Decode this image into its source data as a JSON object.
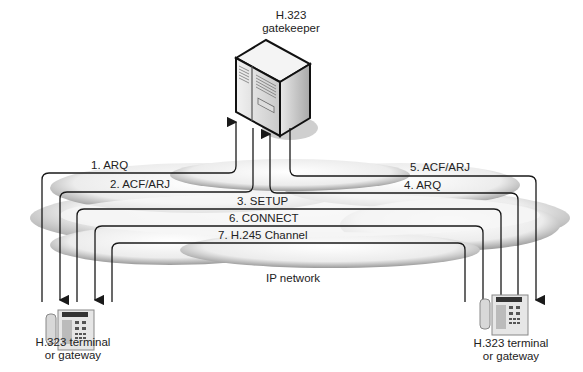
{
  "gatekeeper": {
    "label_line1": "H.323",
    "label_line2": "gatekeeper",
    "icon": "server-icon"
  },
  "network": {
    "label": "IP network",
    "icon": "cloud-icon"
  },
  "terminal_left": {
    "label_line1": "H.323 terminal",
    "label_line2": "or gateway",
    "icon": "phone-icon"
  },
  "terminal_right": {
    "label_line1": "H.323 terminal",
    "label_line2": "or gateway",
    "icon": "phone-icon"
  },
  "messages": [
    {
      "step": 1,
      "label": "1. ARQ",
      "from": "terminal_left",
      "to": "gatekeeper"
    },
    {
      "step": 2,
      "label": "2. ACF/ARJ",
      "from": "gatekeeper",
      "to": "terminal_left"
    },
    {
      "step": 3,
      "label": "3. SETUP",
      "from": "terminal_left",
      "to": "terminal_right"
    },
    {
      "step": 4,
      "label": "4. ARQ",
      "from": "terminal_right",
      "to": "gatekeeper"
    },
    {
      "step": 5,
      "label": "5. ACF/ARJ",
      "from": "gatekeeper",
      "to": "terminal_right"
    },
    {
      "step": 6,
      "label": "6. CONNECT",
      "from": "terminal_right",
      "to": "terminal_left"
    },
    {
      "step": 7,
      "label": "7. H.245 Channel",
      "from": "terminal_left",
      "to": "terminal_right"
    }
  ],
  "colors": {
    "line": "#1a1a1a",
    "cloud_light": "#f4f4f4",
    "cloud_shade": "#9a9a9a"
  }
}
